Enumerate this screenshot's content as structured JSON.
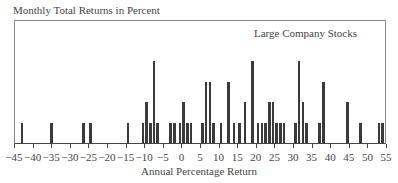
{
  "chart_data": {
    "type": "bar",
    "title": "",
    "ylabel": "Monthly Total Returns in Percent",
    "xlabel": "Annual Percentage Return",
    "legend": [
      "Large Company Stocks"
    ],
    "legend_position": "top-right inside",
    "xlim": [
      -45,
      55
    ],
    "x_ticks": [
      -45,
      -40,
      -35,
      -30,
      -25,
      -20,
      -15,
      -10,
      -5,
      0,
      5,
      10,
      15,
      20,
      25,
      30,
      35,
      40,
      45,
      50,
      55
    ],
    "x_tick_labels": [
      "−45",
      "−40",
      "−35",
      "−30",
      "−25",
      "−20",
      "−15",
      "−10",
      "−5",
      "0",
      "5",
      "10",
      "15",
      "20",
      "25",
      "30",
      "35",
      "40",
      "45",
      "50",
      "55"
    ],
    "grid": false,
    "series": [
      {
        "name": "Large Company Stocks",
        "points": [
          {
            "x": -43,
            "y": 1
          },
          {
            "x": -35,
            "y": 1
          },
          {
            "x": -26.5,
            "y": 1
          },
          {
            "x": -24.5,
            "y": 1
          },
          {
            "x": -14.5,
            "y": 1
          },
          {
            "x": -10.5,
            "y": 1
          },
          {
            "x": -9.5,
            "y": 2
          },
          {
            "x": -8.5,
            "y": 1
          },
          {
            "x": -7.5,
            "y": 4
          },
          {
            "x": -6.5,
            "y": 1
          },
          {
            "x": -3,
            "y": 1
          },
          {
            "x": -2,
            "y": 1
          },
          {
            "x": -0.5,
            "y": 1
          },
          {
            "x": 0.5,
            "y": 2
          },
          {
            "x": 1.5,
            "y": 1
          },
          {
            "x": 2.5,
            "y": 1
          },
          {
            "x": 5.5,
            "y": 1
          },
          {
            "x": 6.5,
            "y": 3
          },
          {
            "x": 7.5,
            "y": 3
          },
          {
            "x": 8.5,
            "y": 1
          },
          {
            "x": 10.5,
            "y": 1
          },
          {
            "x": 12.5,
            "y": 3
          },
          {
            "x": 14,
            "y": 1
          },
          {
            "x": 15.5,
            "y": 1
          },
          {
            "x": 17,
            "y": 2
          },
          {
            "x": 19,
            "y": 4
          },
          {
            "x": 20.5,
            "y": 1
          },
          {
            "x": 21.5,
            "y": 1
          },
          {
            "x": 22.5,
            "y": 1
          },
          {
            "x": 23.5,
            "y": 2
          },
          {
            "x": 24.5,
            "y": 2
          },
          {
            "x": 25.5,
            "y": 1
          },
          {
            "x": 26.5,
            "y": 1
          },
          {
            "x": 27.5,
            "y": 1
          },
          {
            "x": 30.5,
            "y": 1
          },
          {
            "x": 31.5,
            "y": 4
          },
          {
            "x": 32.5,
            "y": 2
          },
          {
            "x": 33.5,
            "y": 1
          },
          {
            "x": 37,
            "y": 1
          },
          {
            "x": 38,
            "y": 3
          },
          {
            "x": 44.5,
            "y": 2
          },
          {
            "x": 48,
            "y": 1
          },
          {
            "x": 53,
            "y": 1
          },
          {
            "x": 54,
            "y": 1
          }
        ]
      }
    ],
    "bar_color": "#3a3a3a"
  }
}
